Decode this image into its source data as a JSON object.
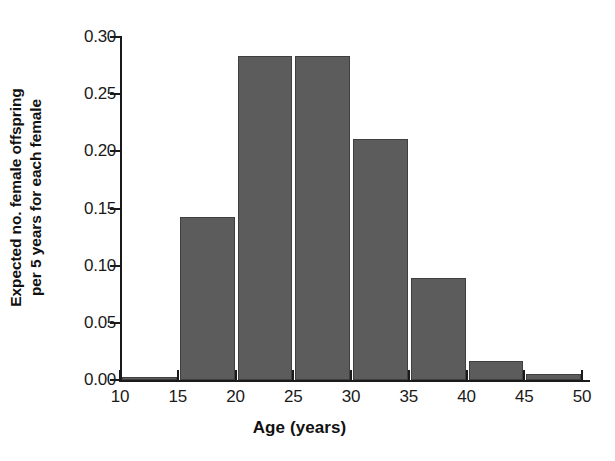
{
  "chart_data": {
    "type": "bar",
    "title": "",
    "subtitle": "",
    "xlabel": "Age (years)",
    "ylabel": "Expected no. female offspring\nper 5 years for each female",
    "ylabel_lines": [
      "Expected no. female offspring",
      "per 5 years for each female"
    ],
    "xlim": [
      10,
      50
    ],
    "ylim": [
      0.0,
      0.3
    ],
    "x_tick_labels": [
      "10",
      "15",
      "20",
      "25",
      "30",
      "35",
      "40",
      "45",
      "50"
    ],
    "x_tick_values": [
      10,
      15,
      20,
      25,
      30,
      35,
      40,
      45,
      50
    ],
    "y_tick_labels": [
      "0.30",
      "0.25",
      "0.20",
      "0.15",
      "0.10",
      "0.05",
      "0.00"
    ],
    "y_tick_values": [
      0.3,
      0.25,
      0.2,
      0.15,
      0.1,
      0.05,
      0.0
    ],
    "grid": false,
    "legend": false,
    "bar_color": "#5c5c5c",
    "bar_edge_color": "#3f3f3f",
    "axis_color": "#1a1a1a",
    "background": "#ffffff",
    "bin_edges": [
      10,
      15,
      20,
      25,
      30,
      35,
      40,
      45,
      50
    ],
    "categories": [
      "10-15",
      "15-20",
      "20-25",
      "25-30",
      "30-35",
      "35-40",
      "40-45",
      "45-50"
    ],
    "values": [
      0.003,
      0.143,
      0.283,
      0.283,
      0.211,
      0.089,
      0.017,
      0.005
    ],
    "bars": [
      {
        "bin": "10-15",
        "x_start": 10,
        "x_end": 15,
        "value": 0.003
      },
      {
        "bin": "15-20",
        "x_start": 15,
        "x_end": 20,
        "value": 0.143
      },
      {
        "bin": "20-25",
        "x_start": 20,
        "x_end": 25,
        "value": 0.283
      },
      {
        "bin": "25-30",
        "x_start": 25,
        "x_end": 30,
        "value": 0.283
      },
      {
        "bin": "30-35",
        "x_start": 30,
        "x_end": 35,
        "value": 0.211
      },
      {
        "bin": "35-40",
        "x_start": 35,
        "x_end": 40,
        "value": 0.089
      },
      {
        "bin": "40-45",
        "x_start": 40,
        "x_end": 45,
        "value": 0.017
      },
      {
        "bin": "45-50",
        "x_start": 45,
        "x_end": 50,
        "value": 0.005
      }
    ]
  }
}
